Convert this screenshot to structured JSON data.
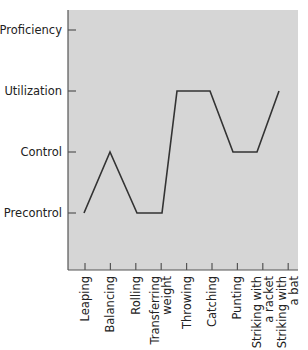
{
  "chart_data": {
    "type": "line",
    "title": "",
    "xlabel": "",
    "ylabel": "",
    "categories": [
      "Leaping",
      "Balancing",
      "Rolling",
      "Transferring weight",
      "Throwing",
      "Catching",
      "Punting",
      "Striking with a racket",
      "Striking with a bat"
    ],
    "category_label_lines": [
      [
        "Leaping"
      ],
      [
        "Balancing"
      ],
      [
        "Rolling"
      ],
      [
        "Transferring",
        "weight"
      ],
      [
        "Throwing"
      ],
      [
        "Catching"
      ],
      [
        "Punting"
      ],
      [
        "Striking with",
        "a racket"
      ],
      [
        "Striking with",
        "a bat"
      ]
    ],
    "y_levels": [
      "Precontrol",
      "Control",
      "Utilization",
      "Proficiency"
    ],
    "series": [
      {
        "name": "Skill level",
        "values": [
          "Precontrol",
          "Control",
          "Precontrol",
          "Precontrol",
          "Utilization",
          "Utilization",
          "Control",
          "Control",
          "Utilization"
        ],
        "numeric_values": [
          1,
          2,
          1,
          1,
          3,
          3,
          2,
          2,
          3
        ]
      }
    ],
    "ylim": [
      0,
      4
    ],
    "grid": false,
    "legend": "none",
    "colors": {
      "plot_background": "#d6d6d6",
      "line": "#333333",
      "axis": "#555555"
    }
  }
}
